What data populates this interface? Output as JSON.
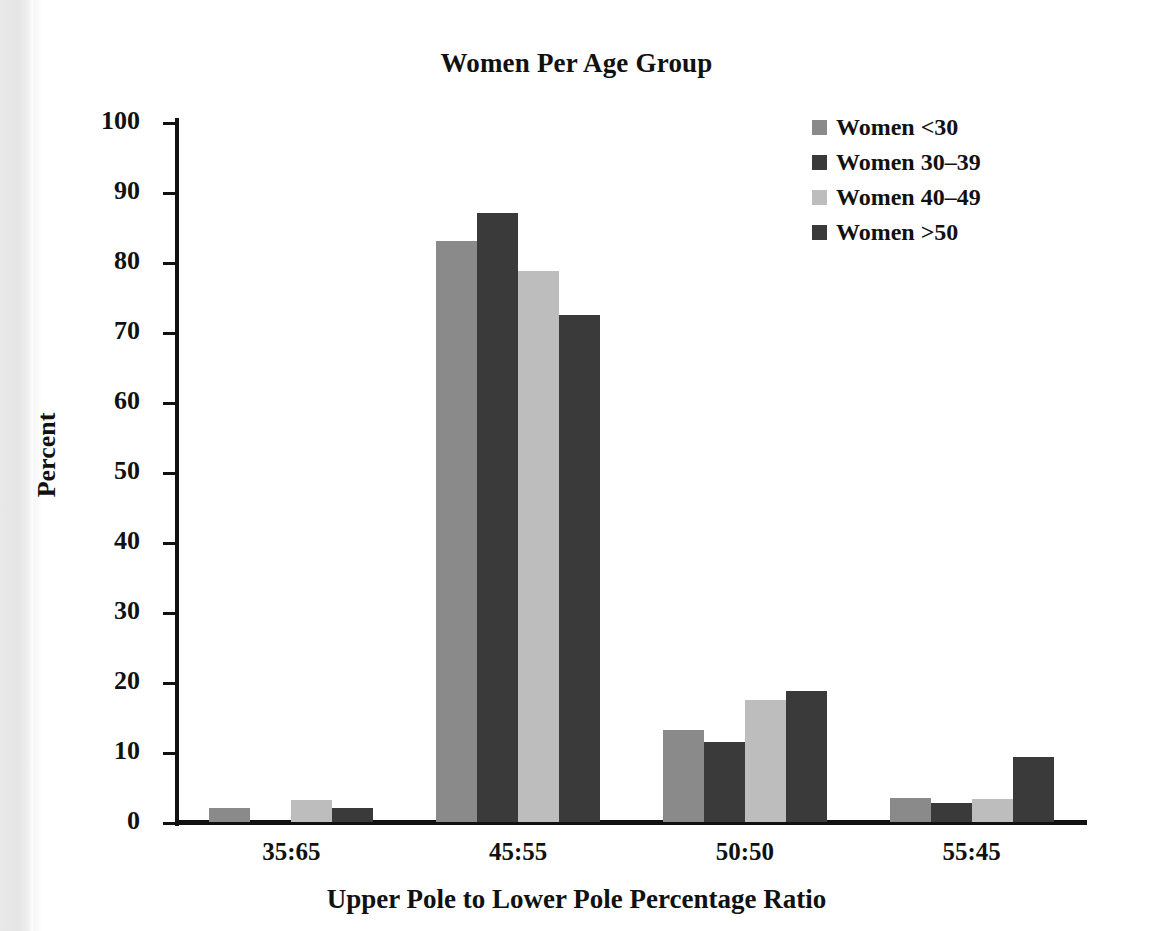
{
  "chart_data": {
    "type": "bar",
    "title": "Women Per Age Group",
    "xlabel": "Upper Pole to Lower Pole Percentage Ratio",
    "ylabel": "Percent",
    "categories": [
      "35:65",
      "45:55",
      "50:50",
      "55:45"
    ],
    "ylim": [
      0,
      100
    ],
    "yticks": [
      0,
      10,
      20,
      30,
      40,
      50,
      60,
      70,
      80,
      90,
      100
    ],
    "ytick_labels": [
      "0",
      "10",
      "20",
      "30",
      "40",
      "50",
      "60",
      "70",
      "80",
      "90",
      "100"
    ],
    "grid": false,
    "legend_position": "top-right",
    "series": [
      {
        "name": "Women <30",
        "color": "#8a8a8a",
        "values": [
          2.0,
          83.0,
          13.1,
          3.5
        ]
      },
      {
        "name": "Women 30–39",
        "color": "#3a3a3a",
        "values": [
          0.0,
          87.0,
          11.5,
          2.7
        ]
      },
      {
        "name": "Women 40–49",
        "color": "#bdbdbd",
        "values": [
          3.1,
          78.7,
          17.4,
          3.3
        ]
      },
      {
        "name": "Women >50",
        "color": "#3a3a3a",
        "values": [
          2.0,
          72.5,
          18.7,
          9.3
        ]
      }
    ]
  }
}
